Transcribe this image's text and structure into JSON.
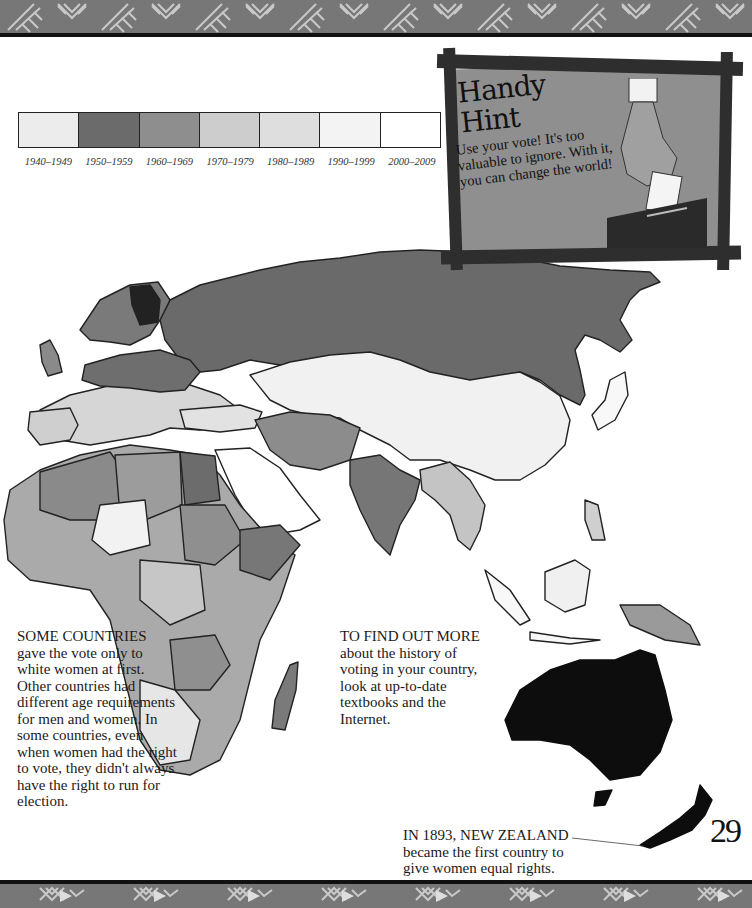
{
  "page": {
    "number": "29"
  },
  "legend": {
    "title": "",
    "items": [
      {
        "label": "1940–1949",
        "color": "#ececec"
      },
      {
        "label": "1950–1959",
        "color": "#6b6b6b"
      },
      {
        "label": "1960–1969",
        "color": "#8e8e8e"
      },
      {
        "label": "1970–1979",
        "color": "#cdcdcd"
      },
      {
        "label": "1980–1989",
        "color": "#dedede"
      },
      {
        "label": "1990–1999",
        "color": "#f3f3f3"
      },
      {
        "label": "2000–2009",
        "color": "#ffffff"
      }
    ]
  },
  "hint": {
    "title_line1": "Handy",
    "title_line2": "Hint",
    "text": "Use your vote! It's too valuable to ignore. With it, you can change the world!"
  },
  "sidebar_note": {
    "lead": "SOME COUNTRIES",
    "body": "gave the vote only to white women at first. Other countries had different age requirements for men and women. In some countries, even when women had the right to vote, they didn't always have the right to run for election."
  },
  "find_out_more": {
    "lead": "TO FIND OUT MORE",
    "body": "about the history of voting in your country, look at up-to-date textbooks and the Internet."
  },
  "nz_note": {
    "lead": "IN 1893, NEW ZEALAND",
    "body": "became the first country to give women equal rights."
  },
  "map": {
    "description": "Map of Europe, Africa, Asia and Oceania shaded by decade women gained the vote",
    "shades": {
      "russia": "#6a6a6a",
      "finland": "#222222",
      "australia": "#0d0d0d",
      "new_zealand": "#0d0d0d",
      "india": "#767676",
      "china": "#f1f1f1",
      "europe_west": "#e8e8e8",
      "africa_north": "#8a8a8a",
      "arabia": "#ffffff"
    }
  }
}
